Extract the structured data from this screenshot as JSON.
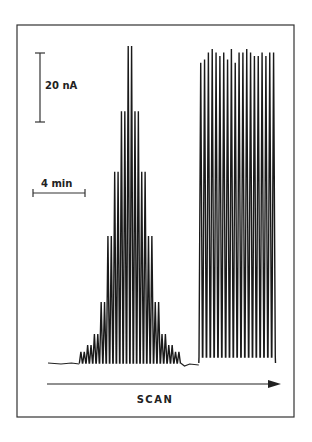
{
  "chart_data": {
    "type": "line",
    "title": "",
    "xlabel": "SCAN",
    "ylabel": "",
    "scale_bars": {
      "current": {
        "label": "20 nA",
        "value": 20,
        "unit": "nA"
      },
      "time": {
        "label": "4 min",
        "value": 4,
        "unit": "min"
      }
    },
    "baseline_nA": 0,
    "series": [
      {
        "name": "left-group",
        "description": "Pairs of sharp peaks increasing then decreasing in amplitude",
        "peak_heights_nA": [
          3.2,
          3.2,
          5.2,
          5.2,
          8.4,
          8.4,
          17.7,
          17.7,
          36.8,
          36.8,
          55.4,
          55.4,
          73.0,
          73.0,
          91.9,
          91.9,
          73.0,
          73.0,
          55.4,
          55.4,
          36.8,
          36.8,
          17.7,
          17.7,
          8.4,
          8.4,
          5.2,
          5.2,
          3.2,
          3.2
        ],
        "start_min": 2.4,
        "end_min": 10.2
      },
      {
        "name": "right-group",
        "description": "Regular peaks of nearly constant maximum amplitude",
        "peak_heights_nA": [
          87,
          88,
          90,
          91,
          90,
          89,
          90,
          88,
          91,
          87,
          90,
          90,
          91,
          90,
          89,
          89,
          90,
          89,
          90,
          90
        ],
        "start_min": 11.6,
        "end_min": 17.5
      }
    ],
    "grid": false,
    "legend": "none"
  }
}
